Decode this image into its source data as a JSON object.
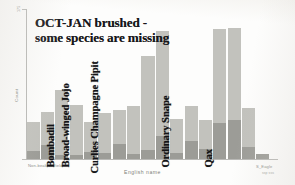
{
  "chart_data": {
    "type": "bar",
    "stacked": true,
    "title": "OCT-JAN brushed - some species are missing",
    "title_lines": [
      "OCT-JAN brushed -",
      "some species are missing"
    ],
    "xlabel": "English name",
    "ylabel": "Count",
    "ylim": [
      0,
      175
    ],
    "ytick_labels": [
      "175",
      "0"
    ],
    "grid": false,
    "legend": null,
    "xtick_labels": [
      "Non-beak Wilfield",
      "S_Eagle"
    ],
    "xtick_sublabel": "ssp sss",
    "categories": [
      "bar-1",
      "bar-2",
      "bar-3",
      "bar-4",
      "bar-5",
      "bar-6",
      "bar-7",
      "bar-8",
      "bar-9",
      "bar-10",
      "bar-11",
      "bar-12",
      "bar-13",
      "bar-14",
      "bar-15",
      "bar-16",
      "bar-17"
    ],
    "series": [
      {
        "name": "lower-segment",
        "color": "#9c9c97",
        "values": [
          9,
          16,
          5,
          5,
          8,
          7,
          17,
          6,
          10,
          27,
          7,
          21,
          12,
          42,
          45,
          14,
          6
        ]
      },
      {
        "name": "upper-segment",
        "color": "#c2c2bd",
        "values": [
          34,
          39,
          76,
          58,
          35,
          47,
          40,
          56,
          110,
          122,
          40,
          41,
          34,
          110,
          108,
          46,
          0
        ]
      }
    ],
    "totals": [
      43,
      55,
      81,
      63,
      43,
      54,
      57,
      62,
      120,
      149,
      47,
      62,
      46,
      152,
      153,
      60,
      6
    ],
    "annotations": [
      {
        "text": "Bombadil",
        "bar_index": 2
      },
      {
        "text": "Broad-winged Jojo",
        "bar_index": 3
      },
      {
        "text": "Curlies Champagne Pipit",
        "bar_index": 5
      },
      {
        "text": "Ordinary Snape",
        "bar_index": 10
      },
      {
        "text": "Qax",
        "bar_index": 13
      }
    ]
  }
}
